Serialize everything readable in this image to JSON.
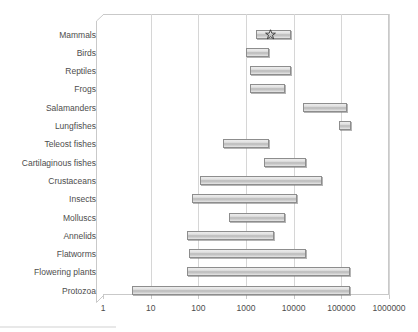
{
  "chart_data": {
    "type": "bar",
    "orientation": "horizontal",
    "bar_style": "range",
    "title": "",
    "xlabel": "",
    "ylabel": "",
    "xscale": "log",
    "xlim": [
      1,
      1000000
    ],
    "grid": true,
    "legend": null,
    "xticks": [
      1,
      10,
      100,
      1000,
      10000,
      100000,
      1000000
    ],
    "xtick_labels": [
      "1",
      "10",
      "100",
      "1000",
      "10000",
      "100000",
      "1000000"
    ],
    "categories": [
      "Mammals",
      "Birds",
      "Reptiles",
      "Frogs",
      "Salamanders",
      "Lungfishes",
      "Teleost fishes",
      "Cartilaginous fishes",
      "Crustaceans",
      "Insects",
      "Molluscs",
      "Annelids",
      "Flatworms",
      "Flowering plants",
      "Protozoa"
    ],
    "ranges": [
      {
        "category": "Mammals",
        "start": 1600,
        "end": 9000,
        "marker": "star",
        "marker_value": 3300
      },
      {
        "category": "Birds",
        "start": 1000,
        "end": 3000,
        "marker": null
      },
      {
        "category": "Reptiles",
        "start": 1200,
        "end": 9000,
        "marker": null
      },
      {
        "category": "Frogs",
        "start": 1200,
        "end": 6500,
        "marker": null
      },
      {
        "category": "Salamanders",
        "start": 16000,
        "end": 130000,
        "marker": null
      },
      {
        "category": "Lungfishes",
        "start": 90000,
        "end": 160000,
        "marker": null
      },
      {
        "category": "Teleost fishes",
        "start": 330,
        "end": 3000,
        "marker": null
      },
      {
        "category": "Cartilaginous fishes",
        "start": 2400,
        "end": 18000,
        "marker": null
      },
      {
        "category": "Crustaceans",
        "start": 110,
        "end": 40000,
        "marker": null
      },
      {
        "category": "Insects",
        "start": 72,
        "end": 12000,
        "marker": null
      },
      {
        "category": "Molluscs",
        "start": 430,
        "end": 6500,
        "marker": null
      },
      {
        "category": "Annelids",
        "start": 58,
        "end": 3800,
        "marker": null
      },
      {
        "category": "Flatworms",
        "start": 64,
        "end": 18000,
        "marker": null
      },
      {
        "category": "Flowering plants",
        "start": 58,
        "end": 150000,
        "marker": null
      },
      {
        "category": "Protozoa",
        "start": 4,
        "end": 150000,
        "marker": null
      }
    ]
  }
}
